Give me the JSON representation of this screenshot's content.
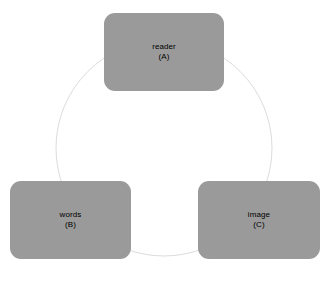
{
  "diagram": {
    "type": "cycle-diagram",
    "background_color": "#ffffff",
    "node_fill_color": "#9a9a9a",
    "node_text_color": "#000000",
    "ring": {
      "name": "cycle-ring",
      "shape": "circle",
      "stroke_color": "#dcdcdc",
      "stroke_width": 1,
      "center_x": 164,
      "center_y": 148,
      "radius": 108,
      "arrowheads": "none"
    },
    "nodes": [
      {
        "id": "A",
        "label": "reader",
        "tag": "(A)",
        "position": "top"
      },
      {
        "id": "B",
        "label": "words",
        "tag": "(B)",
        "position": "bottom-left"
      },
      {
        "id": "C",
        "label": "image",
        "tag": "(C)",
        "position": "bottom-right"
      }
    ]
  }
}
